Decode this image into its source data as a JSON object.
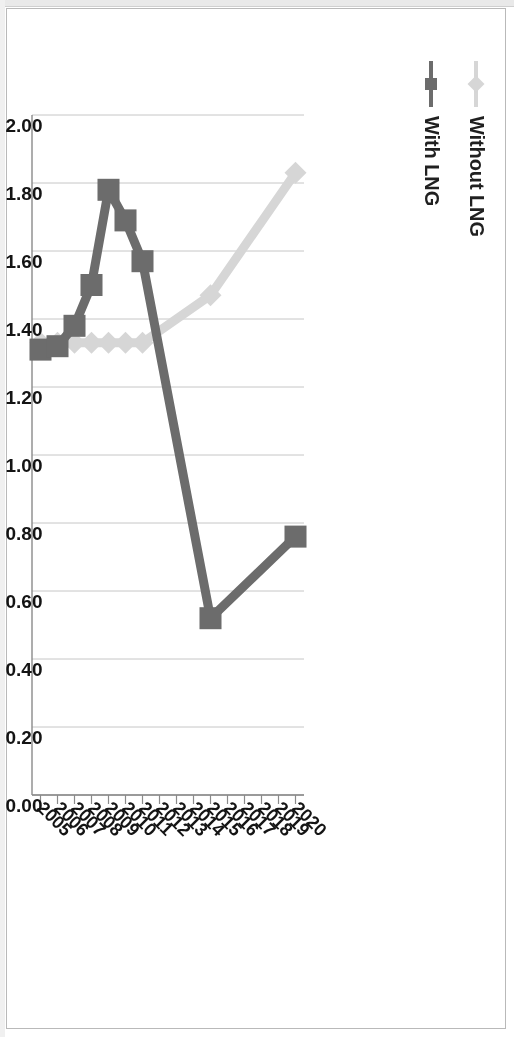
{
  "document": {
    "kind": "scanned-figure",
    "orientation": "rotated-90-clockwise"
  },
  "legend": {
    "position": "top-left",
    "items": [
      {
        "label": "Without LNG",
        "color": "#d9d9d9",
        "marker": "diamond"
      },
      {
        "label": "With LNG",
        "color": "#6b6b6b",
        "marker": "square"
      }
    ]
  },
  "axes": {
    "value_axis": {
      "labels": [
        "2.00",
        "1.80",
        "1.60",
        "1.40",
        "1.20",
        "1.00",
        "0.80",
        "0.60",
        "0.40",
        "0.20",
        "0.00"
      ],
      "min": 0.0,
      "max": 2.0,
      "step": 0.2
    },
    "category_axis": {
      "labels": [
        "2005",
        "2006",
        "2007",
        "2008",
        "2009",
        "2010",
        "2011",
        "2012",
        "2013",
        "2014",
        "2015",
        "2016",
        "2017",
        "2018",
        "2019",
        "2020"
      ]
    }
  },
  "chart_data": {
    "type": "line",
    "title": "",
    "xlabel": "",
    "ylabel": "",
    "categories": [
      "2005",
      "2006",
      "2007",
      "2008",
      "2009",
      "2010",
      "2011",
      "2012",
      "2013",
      "2014",
      "2015",
      "2016",
      "2017",
      "2018",
      "2019",
      "2020"
    ],
    "ylim": [
      0.0,
      2.0
    ],
    "ytick_step": 0.2,
    "grid": "value-axis gridlines only",
    "legend_position": "top-left",
    "orientation": "plotted sideways (rotated 90 degrees clockwise in the scan)",
    "series": [
      {
        "name": "Without LNG",
        "color": "#d9d9d9",
        "marker": "diamond",
        "values": [
          1.33,
          1.33,
          1.33,
          1.33,
          1.33,
          1.33,
          1.33,
          null,
          null,
          null,
          1.47,
          null,
          null,
          null,
          null,
          1.83
        ]
      },
      {
        "name": "With LNG",
        "color": "#6b6b6b",
        "marker": "square",
        "values": [
          1.31,
          1.32,
          1.38,
          1.5,
          1.78,
          1.69,
          1.57,
          null,
          null,
          null,
          0.52,
          null,
          null,
          null,
          null,
          0.76
        ]
      }
    ]
  }
}
